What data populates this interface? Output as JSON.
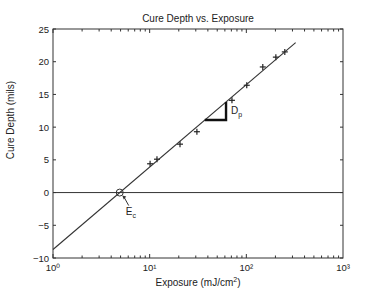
{
  "chart_data": {
    "type": "scatter",
    "title": "Cure Depth vs. Exposure",
    "xlabel": "Exposure (mJ/cm²)",
    "ylabel": "Cure Depth (mils)",
    "xscale": "log",
    "xlim": [
      1,
      1000
    ],
    "ylim": [
      -10,
      25
    ],
    "xticks": [
      1,
      10,
      100,
      1000
    ],
    "xtick_labels": [
      "10⁰",
      "10¹",
      "10²",
      "10³"
    ],
    "yticks": [
      -10,
      -5,
      0,
      5,
      10,
      15,
      20,
      25
    ],
    "ytick_labels": [
      "−10",
      "−5",
      "0",
      "5",
      "10",
      "15",
      "20",
      "25"
    ],
    "grid": false,
    "series": [
      {
        "name": "measured",
        "marker": "+",
        "x": [
          10.1,
          11.9,
          20.6,
          30.8,
          71,
          101,
          148,
          202,
          250
        ],
        "y": [
          4.4,
          5.1,
          7.4,
          9.3,
          14.1,
          16.4,
          19.2,
          20.7,
          21.5
        ]
      },
      {
        "name": "fit",
        "type": "line",
        "x": [
          1,
          320
        ],
        "y": [
          -8.7,
          22.9
        ],
        "slope_per_decade": 12.6,
        "intercept_Ec": 4.9
      },
      {
        "name": "zero-line",
        "type": "hline",
        "y": 0
      }
    ],
    "annotations": [
      {
        "text": "Ec",
        "main": "E",
        "sub": "c",
        "target": [
          4.9,
          0
        ],
        "marker": "circle-with-arrow"
      },
      {
        "text": "Dp",
        "main": "D",
        "sub": "p",
        "description": "slope triangle"
      }
    ]
  }
}
